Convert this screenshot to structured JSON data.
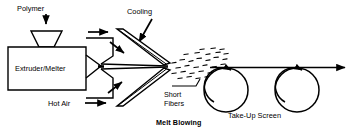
{
  "diagram": {
    "title": "Melt Blowing",
    "labels": {
      "polymer": "Polymer",
      "cooling": "Cooling",
      "extruder": "Extruder/Melter",
      "hot_air": "Hot Air",
      "short_fibers_line1": "Short",
      "short_fibers_line2": "Fibers",
      "take_up_screen": "Take-Up Screen",
      "caption": "Melt Blowing"
    },
    "colors": {
      "stroke": "#000000",
      "background": "#ffffff",
      "fill_white": "#ffffff"
    },
    "components": [
      {
        "name": "hopper",
        "label": "Polymer",
        "type": "funnel"
      },
      {
        "name": "extruder-body",
        "label": "Extruder/Melter",
        "type": "rectangle"
      },
      {
        "name": "die-block",
        "label": "",
        "type": "nozzle"
      },
      {
        "name": "upper-air-knife",
        "label": "Cooling",
        "type": "angled-bar"
      },
      {
        "name": "lower-air-knife",
        "label": "Hot Air",
        "type": "angled-bar"
      },
      {
        "name": "fiber-spray",
        "label": "Short Fibers",
        "type": "particle-cloud"
      },
      {
        "name": "take-up-roller-left",
        "label": "Take-Up Screen",
        "type": "roller",
        "rotation": "counter-clockwise"
      },
      {
        "name": "take-up-roller-right",
        "label": "Take-Up Screen",
        "type": "roller",
        "rotation": "counter-clockwise"
      },
      {
        "name": "web-line",
        "label": "",
        "type": "arrow-line",
        "direction": "right"
      }
    ],
    "arrows": [
      {
        "name": "polymer-feed-arrow",
        "direction": "down"
      },
      {
        "name": "melt-flow-arrow",
        "direction": "right"
      },
      {
        "name": "cooling-arrow",
        "direction": "down-left"
      },
      {
        "name": "hot-air-arrow",
        "direction": "right"
      },
      {
        "name": "upper-knife-arrow",
        "direction": "down-right"
      },
      {
        "name": "lower-knife-arrow",
        "direction": "up-right"
      },
      {
        "name": "web-exit-arrow",
        "direction": "right"
      }
    ]
  }
}
